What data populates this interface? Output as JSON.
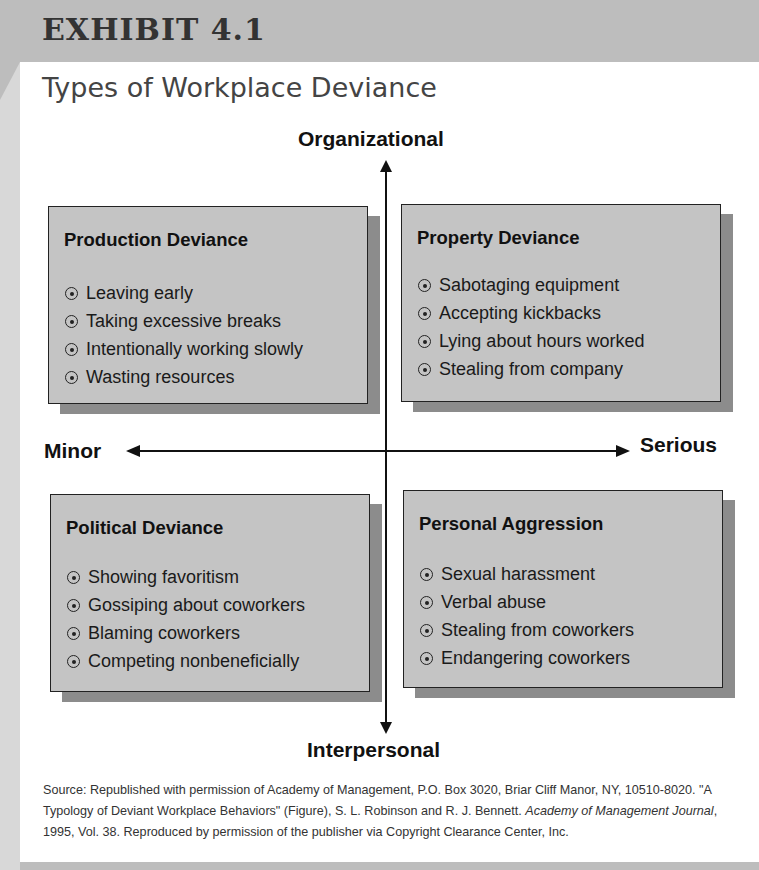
{
  "header": {
    "exhibit": "EXHIBIT 4.1",
    "title": "Types of Workplace Deviance"
  },
  "axes": {
    "top": "Organizational",
    "bottom": "Interpersonal",
    "left": "Minor",
    "right": "Serious"
  },
  "quadrants": [
    {
      "title": "Production Deviance",
      "items": [
        "Leaving early",
        "Taking excessive breaks",
        "Intentionally working slowly",
        "Wasting resources"
      ]
    },
    {
      "title": "Property Deviance",
      "items": [
        "Sabotaging equipment",
        "Accepting kickbacks",
        "Lying about hours worked",
        "Stealing from company"
      ]
    },
    {
      "title": "Political Deviance",
      "items": [
        "Showing favoritism",
        "Gossiping about coworkers",
        "Blaming coworkers",
        "Competing nonbeneficially"
      ]
    },
    {
      "title": "Personal Aggression",
      "items": [
        "Sexual harassment",
        "Verbal abuse",
        "Stealing from coworkers",
        "Endangering coworkers"
      ]
    }
  ],
  "source": {
    "part1": "Source: Republished with permission of Academy of Management, P.O. Box 3020, Briar Cliff Manor, NY, 10510-8020. \"A Typology of Deviant Workplace Behaviors\" (Figure), S. L. Robinson and R. J. Bennett. ",
    "journal": "Academy of Management Journal",
    "part2": ", 1995, Vol. 38. Reproduced by permission of the publisher via Copyright Clearance Center, Inc."
  },
  "colors": {
    "band": "#bdbdbd",
    "box_fill": "#c4c4c4",
    "box_shadow": "#8c8c8c"
  }
}
